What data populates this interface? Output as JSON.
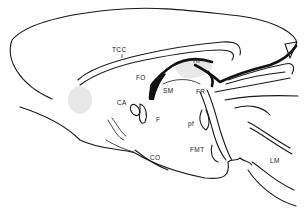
{
  "diagram": {
    "colors": {
      "line": "#1a1a1a",
      "shade": "#e8e8e8",
      "background": "#ffffff"
    },
    "labels": {
      "tcc": "TCC",
      "fo": "FO",
      "hi": "HI",
      "sm": "SM",
      "fr": "FR",
      "ca": "CA",
      "f": "F",
      "pf": "pf",
      "fmt": "FMT",
      "co": "CO",
      "lm": "LM"
    }
  }
}
